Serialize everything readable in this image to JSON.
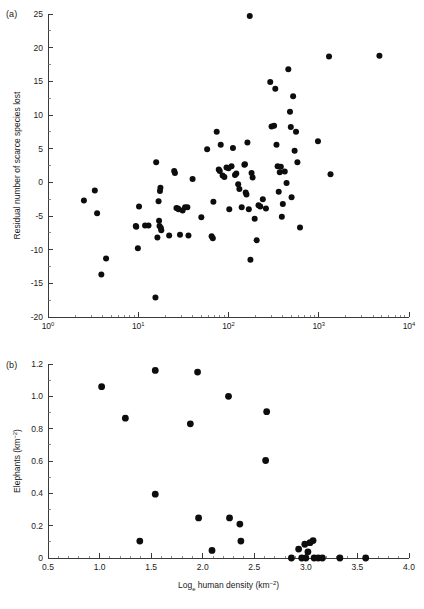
{
  "figure": {
    "panel_a_label": "(a)",
    "panel_b_label": "(b)",
    "marker_color": "#0d0d0d",
    "axis_color": "#3a3a3a"
  },
  "chart_data": [
    {
      "id": "panel-a",
      "type": "scatter",
      "panel": "(a)",
      "title": "",
      "xlabel": "Human density (km⁻²)",
      "ylabel": "Residual number of scarce species lost",
      "xscale": "log",
      "yscale": "linear",
      "xlim": [
        1,
        10000
      ],
      "ylim": [
        -20,
        25
      ],
      "grid": false,
      "legend": "none",
      "xticks": [
        1,
        10,
        100,
        1000,
        10000
      ],
      "xticklabels": [
        "10⁰",
        "10¹",
        "10²",
        "10³",
        "10⁴"
      ],
      "yticks": [
        -20,
        -15,
        -10,
        -5,
        0,
        5,
        10,
        15,
        20,
        25
      ],
      "yticklabels": [
        "-20",
        "-15",
        "-10",
        "-5",
        "0",
        "5",
        "10",
        "15",
        "20",
        "25"
      ],
      "points": [
        [
          2.5,
          -2.7
        ],
        [
          3.3,
          -1.2
        ],
        [
          3.5,
          -4.6
        ],
        [
          4.4,
          -11.3
        ],
        [
          3.9,
          -13.7
        ],
        [
          9.4,
          -6.5
        ],
        [
          9.5,
          -6.6
        ],
        [
          9.9,
          -9.8
        ],
        [
          10.2,
          -3.6
        ],
        [
          11.9,
          -6.4
        ],
        [
          13.0,
          -6.4
        ],
        [
          15.5,
          -17.1
        ],
        [
          15.8,
          3.0
        ],
        [
          16.3,
          -8.2
        ],
        [
          16.8,
          -2.8
        ],
        [
          17.0,
          -5.7
        ],
        [
          17.2,
          -6.5
        ],
        [
          17.4,
          -1.3
        ],
        [
          17.6,
          -0.8
        ],
        [
          17.8,
          -6.8
        ],
        [
          18.0,
          -7.1
        ],
        [
          22.0,
          -7.9
        ],
        [
          25.0,
          1.7
        ],
        [
          25.5,
          1.4
        ],
        [
          26.5,
          -3.8
        ],
        [
          27.5,
          -3.9
        ],
        [
          28.0,
          -4.0
        ],
        [
          29.0,
          -7.8
        ],
        [
          31.0,
          -4.2
        ],
        [
          33.0,
          -3.7
        ],
        [
          35.0,
          -3.7
        ],
        [
          36.0,
          -7.9
        ],
        [
          40.0,
          0.5
        ],
        [
          50.0,
          -5.2
        ],
        [
          58.0,
          4.9
        ],
        [
          65.0,
          -8.0
        ],
        [
          67.0,
          -8.3
        ],
        [
          68.0,
          -2.9
        ],
        [
          74.0,
          7.5
        ],
        [
          78.0,
          1.9
        ],
        [
          80.0,
          1.7
        ],
        [
          82.0,
          5.6
        ],
        [
          86.0,
          1.0
        ],
        [
          90.0,
          0.8
        ],
        [
          95.0,
          2.2
        ],
        [
          100.0,
          2.1
        ],
        [
          102.0,
          -4.0
        ],
        [
          108.0,
          2.4
        ],
        [
          112.0,
          5.1
        ],
        [
          118.0,
          1.1
        ],
        [
          122.0,
          1.3
        ],
        [
          128.0,
          -0.3
        ],
        [
          132.0,
          -1.0
        ],
        [
          140.0,
          -3.7
        ],
        [
          150.0,
          2.6
        ],
        [
          152.0,
          2.7
        ],
        [
          155.0,
          -1.5
        ],
        [
          158.0,
          -1.8
        ],
        [
          162.0,
          5.9
        ],
        [
          168.0,
          -4.0
        ],
        [
          172.0,
          24.7
        ],
        [
          175.0,
          -11.5
        ],
        [
          180.0,
          1.4
        ],
        [
          185.0,
          0.7
        ],
        [
          195.0,
          -5.4
        ],
        [
          205.0,
          -8.6
        ],
        [
          215.0,
          -3.4
        ],
        [
          225.0,
          -3.6
        ],
        [
          240.0,
          -2.5
        ],
        [
          260.0,
          -3.9
        ],
        [
          290.0,
          14.9
        ],
        [
          300.0,
          8.3
        ],
        [
          320.0,
          8.4
        ],
        [
          330.0,
          13.9
        ],
        [
          340.0,
          5.6
        ],
        [
          350.0,
          2.4
        ],
        [
          360.0,
          -1.4
        ],
        [
          370.0,
          1.5
        ],
        [
          380.0,
          2.3
        ],
        [
          390.0,
          -5.1
        ],
        [
          400.0,
          -3.2
        ],
        [
          420.0,
          1.6
        ],
        [
          440.0,
          -0.1
        ],
        [
          460.0,
          16.8
        ],
        [
          480.0,
          10.5
        ],
        [
          490.0,
          8.2
        ],
        [
          500.0,
          -2.2
        ],
        [
          520.0,
          12.8
        ],
        [
          540.0,
          4.7
        ],
        [
          560.0,
          7.5
        ],
        [
          580.0,
          3.0
        ],
        [
          620.0,
          -6.7
        ],
        [
          980.0,
          6.1
        ],
        [
          1300.0,
          18.7
        ],
        [
          1350.0,
          1.2
        ],
        [
          4700.0,
          18.8
        ]
      ]
    },
    {
      "id": "panel-b",
      "type": "scatter",
      "panel": "(b)",
      "title": "",
      "xlabel": "Logₑ human density (km⁻²)",
      "ylabel": "Elephants (km⁻²)",
      "xscale": "linear",
      "yscale": "linear",
      "xlim": [
        0.5,
        4.0
      ],
      "ylim": [
        0,
        1.2
      ],
      "grid": false,
      "legend": "none",
      "xticks": [
        0.5,
        1.0,
        1.5,
        2.0,
        2.5,
        3.0,
        3.5,
        4.0
      ],
      "xticklabels": [
        "0.5",
        "1.0",
        "1.5",
        "2.0",
        "2.5",
        "3.0",
        "3.5",
        "4.0"
      ],
      "yticks": [
        0,
        0.2,
        0.4,
        0.6,
        0.8,
        1.0,
        1.2
      ],
      "yticklabels": [
        "0",
        "0.2",
        "0.4",
        "0.6",
        "0.8",
        "1.0",
        "1.2"
      ],
      "points": [
        [
          1.02,
          1.06
        ],
        [
          1.25,
          0.865
        ],
        [
          1.39,
          0.105
        ],
        [
          1.54,
          1.16
        ],
        [
          1.54,
          0.395
        ],
        [
          1.88,
          0.83
        ],
        [
          1.95,
          1.15
        ],
        [
          1.96,
          0.248
        ],
        [
          2.09,
          0.047
        ],
        [
          2.25,
          1.0
        ],
        [
          2.26,
          0.248
        ],
        [
          2.36,
          0.21
        ],
        [
          2.37,
          0.105
        ],
        [
          2.62,
          0.905
        ],
        [
          2.61,
          0.603
        ],
        [
          2.86,
          0.0
        ],
        [
          2.93,
          0.055
        ],
        [
          2.96,
          0.0
        ],
        [
          2.99,
          0.085
        ],
        [
          3.0,
          0.0
        ],
        [
          3.02,
          0.038
        ],
        [
          3.04,
          0.095
        ],
        [
          3.07,
          0.108
        ],
        [
          3.08,
          0.0
        ],
        [
          3.12,
          0.0
        ],
        [
          3.16,
          0.0
        ],
        [
          3.33,
          0.0
        ],
        [
          3.58,
          0.0
        ]
      ]
    }
  ]
}
